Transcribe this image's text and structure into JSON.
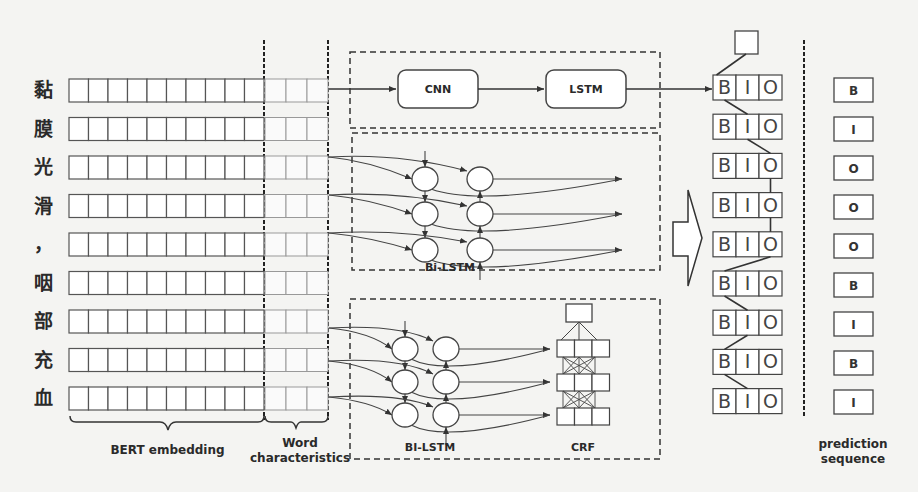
{
  "characters": [
    "黏",
    "膜",
    "光",
    "滑",
    "，",
    "咽",
    "部",
    "充",
    "血"
  ],
  "labels": {
    "bert": "BERT embedding",
    "word_line1": "Word",
    "word_line2": "characteristics",
    "prediction_line1": "prediction",
    "prediction_line2": "sequence"
  },
  "modules": {
    "cnn": "CNN",
    "lstm": "LSTM",
    "bilstm_top": "Bi-LSTM",
    "bilstm_bottom": "BI-LSTM",
    "crf": "CRF"
  },
  "bio_tags": [
    "B",
    "I",
    "O"
  ],
  "prediction_sequence": [
    "B",
    "I",
    "O",
    "O",
    "O",
    "B",
    "I",
    "B",
    "I"
  ],
  "bert_cells_per_row": 10,
  "word_cells_per_row": 3
}
